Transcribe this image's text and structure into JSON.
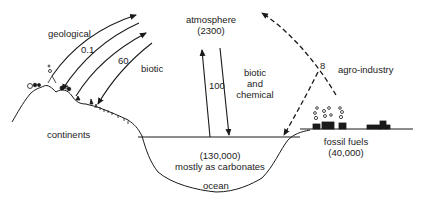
{
  "diagram": {
    "reservoirs": {
      "atmosphere": {
        "name": "atmosphere",
        "amount": "(2300)"
      },
      "ocean": {
        "amount": "(130,000)",
        "note": "mostly as carbonates",
        "name": "ocean"
      },
      "fossil_fuels": {
        "name": "fossil fuels",
        "amount": "(40,000)"
      },
      "continents": {
        "name": "continents"
      }
    },
    "flows": {
      "geological": {
        "label": "geological",
        "value": "0.1"
      },
      "biotic": {
        "label": "biotic",
        "value": "60"
      },
      "ocean_exchange": {
        "value": "100",
        "label_line1": "biotic",
        "label_line2": "and",
        "label_line3": "chemical"
      },
      "agro_industry": {
        "label": "agro-industry",
        "value": "8"
      }
    },
    "colors": {
      "line": "#1a1a1a",
      "background": "#ffffff"
    }
  }
}
